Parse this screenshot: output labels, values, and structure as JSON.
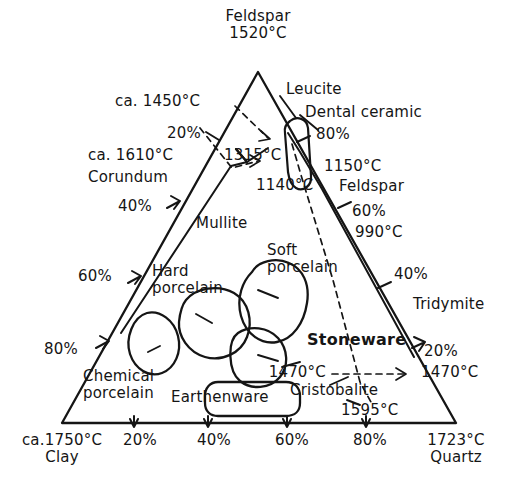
{
  "figure": {
    "type": "ternary-phase-diagram",
    "vertices": {
      "top": {
        "name": "Feldspar",
        "temperature": "1520°C"
      },
      "bottom_left": {
        "name": "Clay",
        "temperature": "ca.1750°C"
      },
      "bottom_right": {
        "name": "Quartz",
        "temperature": "1723°C"
      }
    },
    "axes": {
      "bottom_ticks": [
        "20%",
        "40%",
        "60%",
        "80%"
      ],
      "left_ticks": [
        "20%",
        "40%",
        "60%",
        "80%"
      ],
      "right_ticks": [
        "80%",
        "60%",
        "40%",
        "20%"
      ]
    },
    "phase_fields": [
      "Corundum",
      "Mullite",
      "Feldspar",
      "Tridymite",
      "Cristobalite",
      "Leucite"
    ],
    "product_regions": [
      "Dental ceramic",
      "Hard porcelain",
      "Soft porcelain",
      "Stoneware",
      "Chemical porcelain",
      "Earthenware"
    ],
    "invariant_temperatures": [
      "ca. 1450°C",
      "ca. 1610°C",
      "1315°C",
      "1140°C",
      "1150°C",
      "990°C",
      "1470°C",
      "1595°C"
    ]
  },
  "labels": {
    "apex_feldspar": "Feldspar",
    "apex_feldspar_temp": "1520°C",
    "leucite": "Leucite",
    "dental_ceramic": "Dental ceramic",
    "pct_80_top": "80%",
    "temp_1150": "1150°C",
    "field_feldspar": "Feldspar",
    "pct_60_right": "60%",
    "temp_990": "990°C",
    "temp_ca_1450": "ca. 1450°C",
    "pct_20_left": "20%",
    "temp_ca_1610": "ca. 1610°C",
    "temp_1315": "1315°C",
    "corundum": "Corundum",
    "temp_1140": "1140°C",
    "pct_40_left": "40%",
    "field_mullite": "Mullite",
    "soft_porcelain_l1": "Soft",
    "soft_porcelain_l2": "porcelain",
    "pct_60_left": "60%",
    "hard_porcelain_l1": "Hard",
    "hard_porcelain_l2": "porcelain",
    "pct_40_right": "40%",
    "tridymite": "Tridymite",
    "pct_80_left": "80%",
    "stoneware": "Stoneware",
    "pct_20_right": "20%",
    "chemical_porcelain_l1": "Chemical",
    "chemical_porcelain_l2": "porcelain",
    "earthenware": "Earthenware",
    "temp_1470_inner": "1470°C",
    "temp_1470_right": "1470°C",
    "cristobalite": "Cristobalite",
    "temp_1595": "1595°C",
    "axis_clay_temp": "ca.1750°C",
    "axis_clay": "Clay",
    "axis_bottom_20": "20%",
    "axis_bottom_40": "40%",
    "axis_bottom_60": "60%",
    "axis_bottom_80": "80%",
    "axis_quartz_temp": "1723°C",
    "axis_quartz": "Quartz"
  },
  "colors": {
    "ink": "#151515",
    "background": "#ffffff"
  }
}
